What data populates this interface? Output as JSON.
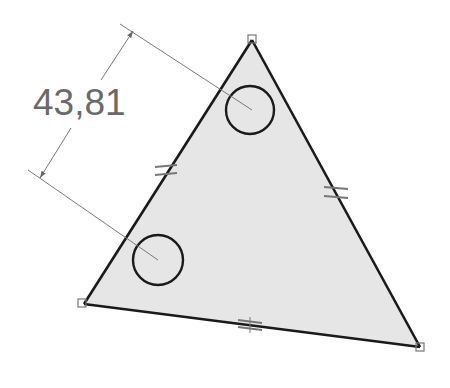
{
  "drawing": {
    "type": "sketch",
    "dimension": {
      "value_label": "43,81",
      "kind": "linear-distance-between-circle-centers"
    },
    "triangle": {
      "vertices": [
        [
          252,
          40
        ],
        [
          84,
          304
        ],
        [
          420,
          347
        ]
      ],
      "fill": "#e6e6e6",
      "stroke": "#1a1a1a",
      "equal_length_constraints": 3
    },
    "circles": [
      {
        "cx": 250,
        "cy": 110,
        "r": 24
      },
      {
        "cx": 158,
        "cy": 260,
        "r": 25
      }
    ],
    "colors": {
      "dimension": "#6a6a6a",
      "outline": "#1a1a1a",
      "fill": "#e6e6e6",
      "constraint_marks": "#777777"
    }
  }
}
